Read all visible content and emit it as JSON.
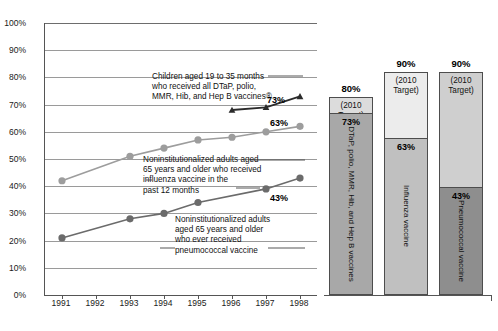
{
  "chart_data": {
    "type": "line",
    "title": "",
    "xlabel": "",
    "ylabel": "",
    "x": [
      1991,
      1992,
      1993,
      1994,
      1995,
      1996,
      1997,
      1998
    ],
    "xlim": [
      1990.5,
      1998.5
    ],
    "ylim": [
      0,
      100
    ],
    "ytick_labels": [
      "0%",
      "10%",
      "20%",
      "30%",
      "40%",
      "50%",
      "60%",
      "70%",
      "80%",
      "90%",
      "100%"
    ],
    "ytick_values": [
      0,
      10,
      20,
      30,
      40,
      50,
      60,
      70,
      80,
      90,
      100
    ],
    "xtick_labels": [
      "1991",
      "1992",
      "1993",
      "1994",
      "1995",
      "1996",
      "1997",
      "1998"
    ],
    "grid": true,
    "legend": "annotations",
    "series": [
      {
        "name": "Children aged 19 to 35 months who received all DTaP, polio, MMR, Hib, and Hep B vaccines",
        "marker": "triangle",
        "color": "#2b2b2b",
        "x": [
          1996,
          1997,
          1998
        ],
        "values": [
          68,
          69,
          73
        ],
        "end_label": "73%"
      },
      {
        "name": "Noninstitutionalized adults aged 65 years and older who received influenza vaccine in the past 12 months",
        "marker": "circle",
        "color": "#9d9d9d",
        "x": [
          1991,
          1993,
          1994,
          1995,
          1996,
          1997,
          1998
        ],
        "values": [
          42,
          51,
          54,
          57,
          58,
          60,
          62
        ],
        "end_label": "63%"
      },
      {
        "name": "Noninstitutionalized adults aged 65 years and older who ever received pneumococcal vaccine",
        "marker": "circle",
        "color": "#6b6b6b",
        "x": [
          1991,
          1993,
          1994,
          1995,
          1997,
          1998
        ],
        "values": [
          21,
          28,
          30,
          34,
          39,
          43
        ],
        "end_label": "43%"
      }
    ],
    "annotations": [
      {
        "id": "children",
        "lines": [
          "Children aged 19 to 35 months",
          "who received all DTaP, polio,",
          "MMR, Hib, and Hep B vaccines®"
        ]
      },
      {
        "id": "influenza",
        "lines": [
          "Noninstitutionalized adults aged",
          "65 years and older who received",
          "influenza vaccine in the",
          "past 12 months"
        ]
      },
      {
        "id": "pneumococcal",
        "lines": [
          "Noninstitutionalized adults",
          "aged 65 years and older",
          "who ever received",
          "pneumococcal vaccine"
        ]
      }
    ],
    "target_bars": {
      "type": "bar",
      "ylim": [
        0,
        100
      ],
      "bars": [
        {
          "name": "DTaP, polio, MMR, Hib, and Hep B vaccines",
          "target_label": "80%",
          "target_text": "(2010 Target)",
          "value_label": "73%",
          "value": 73,
          "target": 80,
          "fill_color": "#a8a8a8",
          "target_color": "#dcdcdc"
        },
        {
          "name": "Influenza vaccine",
          "target_label": "90%",
          "target_text": "(2010 Target)",
          "value_label": "63%",
          "value": 63,
          "target": 90,
          "fill_color": "#c0c0c0",
          "target_color": "#ececec"
        },
        {
          "name": "Pneumococcal vaccine",
          "target_label": "90%",
          "target_text": "(2010 Target)",
          "value_label": "43%",
          "value": 43,
          "target": 90,
          "fill_color": "#8e8e8e",
          "target_color": "#cfcfcf"
        }
      ]
    }
  },
  "caption": ""
}
